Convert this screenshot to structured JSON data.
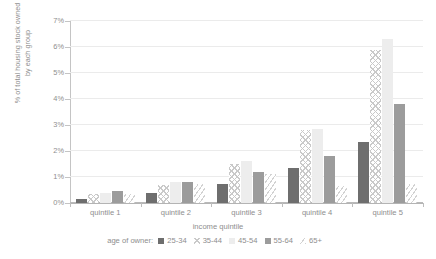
{
  "axes": {
    "y_title_lines": [
      "% of total housing stock owned",
      "by each group"
    ],
    "y_ticks": [
      "0%",
      "1%",
      "2%",
      "3%",
      "4%",
      "5%",
      "6%",
      "7%"
    ],
    "x_title": "income quintile"
  },
  "legend": {
    "title": "age of owner:",
    "items": [
      {
        "label": "25-34",
        "swatch": "solid-dark-square-icon"
      },
      {
        "label": "35-44",
        "swatch": "crosshatch-square-icon"
      },
      {
        "label": "45-54",
        "swatch": "solid-light-square-icon"
      },
      {
        "label": "55-64",
        "swatch": "solid-mid-square-icon"
      },
      {
        "label": "65+",
        "swatch": "diagonal-hatch-square-icon"
      }
    ]
  },
  "chart_data": {
    "type": "bar",
    "title": "",
    "xlabel": "income quintile",
    "ylabel": "% of total housing stock owned by each group",
    "ylim": [
      0,
      7
    ],
    "ytick_values": [
      0,
      1,
      2,
      3,
      4,
      5,
      6,
      7
    ],
    "ytick_labels": [
      "0%",
      "1%",
      "2%",
      "3%",
      "4%",
      "5%",
      "6%",
      "7%"
    ],
    "grid": "horizontal",
    "legend_position": "bottom",
    "legend_title": "age of owner:",
    "categories": [
      "quintile 1",
      "quintile 2",
      "quintile 3",
      "quintile 4",
      "quintile 5"
    ],
    "series": [
      {
        "name": "25-34",
        "values": [
          0.15,
          0.4,
          0.75,
          1.35,
          2.35
        ]
      },
      {
        "name": "35-44",
        "values": [
          0.35,
          0.7,
          1.5,
          2.8,
          5.9
        ]
      },
      {
        "name": "45-54",
        "values": [
          0.4,
          0.8,
          1.6,
          2.85,
          6.3
        ]
      },
      {
        "name": "55-64",
        "values": [
          0.45,
          0.8,
          1.2,
          1.8,
          3.8
        ]
      },
      {
        "name": "65+",
        "values": [
          0.35,
          0.75,
          1.1,
          0.65,
          0.75
        ]
      }
    ]
  },
  "colors": {
    "series_25_34": "#6e6e6e",
    "series_35_44": "#c9c9c9",
    "series_45_54": "#ededed",
    "series_55_64": "#9c9c9c",
    "series_65_plus": "#d2d2d2",
    "gridline": "#ebebeb",
    "axis": "#b9b9b9",
    "text": "#8e8e8e"
  }
}
